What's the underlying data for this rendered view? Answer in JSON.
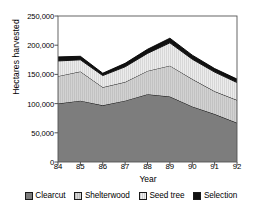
{
  "chart_data": {
    "type": "area",
    "stacked": true,
    "title": "",
    "xlabel": "Year",
    "ylabel": "Hectares harvested",
    "categories": [
      "84",
      "85",
      "86",
      "87",
      "88",
      "89",
      "90",
      "91",
      "92"
    ],
    "x": [
      84,
      85,
      86,
      87,
      88,
      89,
      90,
      91,
      92
    ],
    "xtick_labels": [
      "84",
      "85",
      "86",
      "87",
      "88",
      "89",
      "90",
      "91",
      "92"
    ],
    "ytick_labels": [
      "0",
      "50,000",
      "100,000",
      "150,000",
      "200,000",
      "250,000"
    ],
    "ytick_values": [
      0,
      50000,
      100000,
      150000,
      200000,
      250000
    ],
    "ylim": [
      0,
      250000
    ],
    "grid": false,
    "legend_position": "bottom",
    "series": [
      {
        "name": "Clearcut",
        "color": "#7d7d7d",
        "pattern": "solid",
        "values": [
          100000,
          105000,
          97000,
          105000,
          116000,
          112000,
          95000,
          82000,
          67000
        ]
      },
      {
        "name": "Shelterwood",
        "color": "#d2d2d2",
        "pattern": "vertical-hatch",
        "values": [
          47000,
          50000,
          31000,
          32000,
          40000,
          53000,
          47000,
          39000,
          39000
        ]
      },
      {
        "name": "Seed tree",
        "color": "#e2e2e2",
        "pattern": "vertical-hatch",
        "values": [
          26000,
          20000,
          20000,
          26000,
          30000,
          39000,
          34000,
          33000,
          30000
        ]
      },
      {
        "name": "Selection",
        "color": "#111111",
        "pattern": "solid",
        "values": [
          7000,
          6000,
          4000,
          6000,
          7000,
          8000,
          7000,
          6000,
          6000
        ]
      }
    ],
    "totals": [
      180000,
      181000,
      152000,
      169000,
      193000,
      212000,
      183000,
      160000,
      142000
    ]
  },
  "legend": {
    "items": [
      {
        "label": "Clearcut"
      },
      {
        "label": "Shelterwood"
      },
      {
        "label": "Seed tree"
      },
      {
        "label": "Selection"
      }
    ]
  }
}
